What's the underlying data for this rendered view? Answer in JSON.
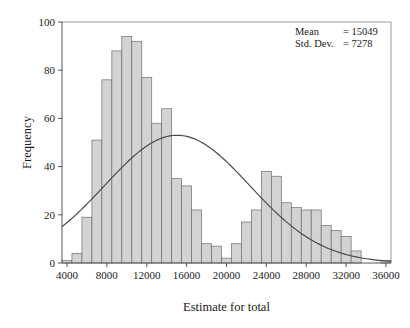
{
  "chart_data": {
    "type": "bar",
    "title": "",
    "xlabel": "Estimate for total",
    "ylabel": "Frequency",
    "xlim": [
      3500,
      36500
    ],
    "ylim": [
      0,
      100
    ],
    "grid": false,
    "bin_width": 1000,
    "xticks": [
      4000,
      8000,
      12000,
      16000,
      20000,
      24000,
      28000,
      32000,
      36000
    ],
    "xtick_labels": [
      "4000",
      "8000",
      "12000",
      "16000",
      "20000",
      "24000",
      "28000",
      "32000",
      "36000"
    ],
    "yticks": [
      0,
      20,
      40,
      60,
      80,
      100
    ],
    "ytick_labels": [
      "0",
      "20",
      "40",
      "60",
      "80",
      "100"
    ],
    "bin_starts": [
      3500,
      4500,
      5500,
      6500,
      7500,
      8500,
      9500,
      10500,
      11500,
      12500,
      13500,
      14500,
      15500,
      16500,
      17500,
      18500,
      19500,
      20500,
      21500,
      22500,
      23500,
      24500,
      25500,
      26500,
      27500,
      28500,
      29500,
      30500,
      31500,
      32500,
      35500
    ],
    "values": [
      1,
      4,
      19,
      51,
      76,
      88,
      94,
      92,
      77,
      58,
      64,
      35,
      32,
      22,
      8,
      7,
      2,
      8,
      17,
      22,
      38,
      36,
      25,
      23,
      22,
      22,
      15.5,
      13.5,
      11,
      5,
      1
    ],
    "series": [
      {
        "name": "Frequency",
        "values": [
          1,
          4,
          19,
          51,
          76,
          88,
          94,
          92,
          77,
          58,
          64,
          35,
          32,
          22,
          8,
          7,
          2,
          8,
          17,
          22,
          38,
          36,
          25,
          23,
          22,
          22,
          15.5,
          13.5,
          11,
          5,
          1
        ]
      }
    ],
    "overlay_curve": {
      "name": "normal-fit",
      "distribution": "normal",
      "mean": 15049,
      "std_dev": 7278,
      "peak_frequency": 53,
      "scale_n_times_binwidth": 967000
    },
    "colors": {
      "bar_fill": "#d3d3d3",
      "bar_edge": "#6e6e6e",
      "curve": "#4a4a4a",
      "frame": "#9a9a9a",
      "text": "#1a1a1a"
    }
  },
  "stats_box": {
    "rows": [
      {
        "label": "Mean",
        "equals": "=",
        "value": "15049"
      },
      {
        "label": "Std. Dev.",
        "equals": "=",
        "value": "7278"
      }
    ]
  }
}
